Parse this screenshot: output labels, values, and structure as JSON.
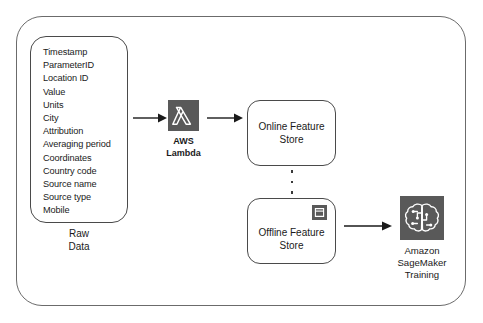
{
  "diagram": {
    "outer_container_label": "architecture-boundary"
  },
  "raw_data": {
    "caption_line1": "Raw",
    "caption_line2": "Data",
    "fields": [
      "Timestamp",
      "ParameterID",
      "Location ID",
      "Value",
      "Units",
      "City",
      "Attribution",
      "Averaging period",
      "Coordinates",
      "Country code",
      "Source name",
      "Source type",
      "Mobile"
    ]
  },
  "lambda": {
    "caption_line1": "AWS",
    "caption_line2": "Lambda",
    "icon": "aws-lambda-icon",
    "icon_glyph": "lambda"
  },
  "online_store": {
    "label_line1": "Online Feature",
    "label_line2": "Store"
  },
  "offline_store": {
    "label_line1": "Offline Feature",
    "label_line2": "Store",
    "icon": "s3-bucket-icon"
  },
  "sagemaker": {
    "caption_line1": "Amazon",
    "caption_line2": "SageMaker",
    "caption_line3": "Training",
    "icon": "amazon-sagemaker-icon",
    "icon_glyph": "brain-circuit"
  },
  "colors": {
    "icon_tile": "#595959",
    "icon_glyph": "#ffffff",
    "stroke": "#4a4a4a",
    "outer_stroke": "#6b6b6b",
    "text": "#1a1a1a",
    "background": "#ffffff"
  }
}
